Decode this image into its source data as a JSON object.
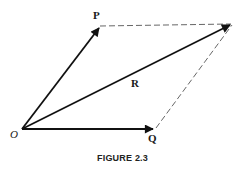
{
  "figure": {
    "caption": "FIGURE 2.3",
    "type": "vector parallelogram",
    "colors": {
      "line": "#111111",
      "dashed": "#555555",
      "background": "#ffffff"
    },
    "points": {
      "O": {
        "label": "O",
        "x": 22,
        "y": 129
      },
      "P": {
        "label": "P",
        "x": 100,
        "y": 27
      },
      "Q": {
        "label": "Q",
        "x": 155,
        "y": 129
      },
      "R_tip": {
        "x": 232,
        "y": 24
      }
    },
    "labels": {
      "O": "O",
      "P": "P",
      "Q": "Q",
      "R": "R"
    },
    "vectors": [
      {
        "name": "P",
        "from": "O",
        "to": "P",
        "style": "solid-arrow"
      },
      {
        "name": "Q",
        "from": "O",
        "to": "Q",
        "style": "solid-arrow"
      },
      {
        "name": "R",
        "from": "O",
        "to": "R_tip",
        "style": "solid-arrow"
      }
    ],
    "dashed_edges": [
      {
        "from": "P",
        "to": "R_tip"
      },
      {
        "from": "Q",
        "to": "R_tip"
      }
    ]
  }
}
